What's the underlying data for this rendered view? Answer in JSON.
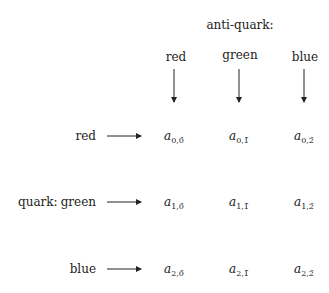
{
  "header": {
    "title": "anti-quark:"
  },
  "columns": [
    {
      "label": "red",
      "bar_index": "0"
    },
    {
      "label": "green",
      "bar_index": "1"
    },
    {
      "label": "blue",
      "bar_index": "2"
    }
  ],
  "row_group_label": "quark:",
  "rows": [
    {
      "label": "red",
      "index": "0"
    },
    {
      "label": "green",
      "index": "1"
    },
    {
      "label": "blue",
      "index": "2"
    }
  ],
  "entry_symbol": "a",
  "cells": [
    [
      "0,0̄",
      "0,1̄",
      "0,2̄"
    ],
    [
      "1,0̄",
      "1,1̄",
      "1,2̄"
    ],
    [
      "2,0̄",
      "2,1̄",
      "2,2̄"
    ]
  ]
}
